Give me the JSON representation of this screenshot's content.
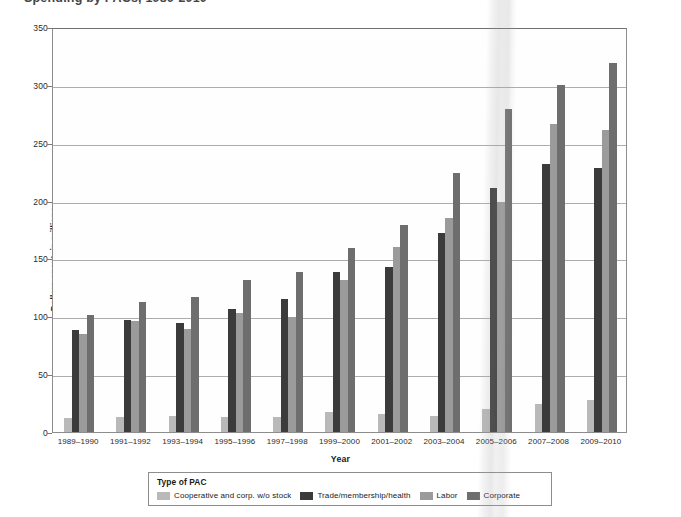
{
  "figure": {
    "title_fragment": "Spending by PACs, 1989-2010",
    "axis_title_y": "Dollars spent, in millions",
    "axis_title_x": "Year"
  },
  "legend": {
    "title": "Type of PAC",
    "entries": [
      {
        "label": "Cooperative and corp. w/o stock",
        "color": "#b9b9b9"
      },
      {
        "label": "Trade/membership/health",
        "color": "#3b3b3b"
      },
      {
        "label": "Labor",
        "color": "#9b9b9b"
      },
      {
        "label": "Corporate",
        "color": "#6e6e6e"
      }
    ]
  },
  "chart_data": {
    "type": "bar",
    "title": "Spending by PACs, 1989-2010",
    "xlabel": "Year",
    "ylabel": "Dollars spent, in millions",
    "ylim": [
      0,
      350
    ],
    "yticks": [
      0,
      50,
      100,
      150,
      200,
      250,
      300,
      350
    ],
    "grid": true,
    "legend_position": "bottom",
    "categories": [
      "1989–1990",
      "1991–1992",
      "1993–1994",
      "1995–1996",
      "1997–1998",
      "1999–2000",
      "2001–2002",
      "2003–2004",
      "2005–2006",
      "2007–2008",
      "2009–2010"
    ],
    "series": [
      {
        "name": "Cooperative and corp. w/o stock",
        "color": "#b9b9b9",
        "values": [
          12,
          13,
          14,
          13,
          13,
          17,
          16,
          14,
          20,
          24,
          28
        ]
      },
      {
        "name": "Trade/membership/health",
        "color": "#3b3b3b",
        "values": [
          88,
          97,
          94,
          106,
          115,
          138,
          143,
          172,
          211,
          232,
          228
        ]
      },
      {
        "name": "Labor",
        "color": "#9b9b9b",
        "values": [
          85,
          96,
          89,
          103,
          99,
          131,
          160,
          185,
          199,
          266,
          261
        ]
      },
      {
        "name": "Corporate",
        "color": "#6e6e6e",
        "values": [
          101,
          112,
          117,
          131,
          138,
          159,
          179,
          224,
          279,
          300,
          319
        ]
      }
    ]
  }
}
